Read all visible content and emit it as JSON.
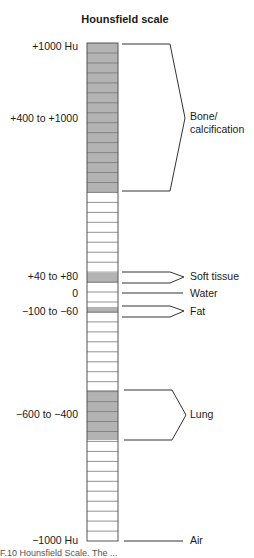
{
  "title": "Hounsfield scale",
  "left_labels": [
    {
      "text": "+1000 Hu",
      "y": 40
    },
    {
      "text": "+400 to +1000",
      "y": 112
    },
    {
      "text": "+40 to +80",
      "y": 270
    },
    {
      "text": "0",
      "y": 287
    },
    {
      "text": "−100 to −60",
      "y": 305
    },
    {
      "text": "−600 to −400",
      "y": 408
    },
    {
      "text": "−1000 Hu",
      "y": 534
    }
  ],
  "right_labels": [
    {
      "text": "Bone/",
      "y": 110
    },
    {
      "text": "calcification",
      "y": 123
    },
    {
      "text": "Soft tissue",
      "y": 270
    },
    {
      "text": "Water",
      "y": 287
    },
    {
      "text": "Fat",
      "y": 305
    },
    {
      "text": "Lung",
      "y": 408
    },
    {
      "text": "Air",
      "y": 534
    }
  ],
  "scale": {
    "bar_left": 87,
    "bar_right": 118,
    "bar_top": 43,
    "bar_bottom": 541,
    "fill_color": "#b3b3b3",
    "line_color": "#555555",
    "shaded_ranges": [
      {
        "name": "bone",
        "from": 43,
        "to": 193
      },
      {
        "name": "soft-tissue",
        "from": 273,
        "to": 283
      },
      {
        "name": "fat",
        "from": 307,
        "to": 313
      },
      {
        "name": "lung",
        "from": 390,
        "to": 440
      }
    ]
  },
  "caption": "F.10  Hounsfield Scale. The ..."
}
